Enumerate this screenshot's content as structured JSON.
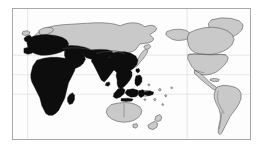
{
  "figure": {
    "kind": "world-map",
    "projection": "pacific-centered-cylindrical",
    "caption": "",
    "frame": {
      "x": 12,
      "y": 8,
      "width": 239,
      "height": 132,
      "border_color": "#a9a9a9",
      "background_color": "#fefefe"
    }
  },
  "legend": {
    "highlight_label": "",
    "plain_label": ""
  },
  "colors": {
    "highlight_fill": "#0d0d0d",
    "plain_fill": "#c9c9c9",
    "coastline": "#4a4a4a",
    "internal_border": "#5a5a5a",
    "graticule": "#d8d8d8",
    "ocean": "#fefefe",
    "page_background": "#ffffff"
  },
  "graticule": {
    "visible": true,
    "parallels": [
      {
        "name": "tropic-of-cancer",
        "y_fraction": 0.355
      },
      {
        "name": "equator",
        "y_fraction": 0.505
      },
      {
        "name": "tropic-of-capricorn",
        "y_fraction": 0.655
      }
    ],
    "meridians": [
      {
        "name": "meridian-west",
        "x_fraction": 0.062
      },
      {
        "name": "meridian-east",
        "x_fraction": 0.735
      }
    ]
  },
  "map_data": {
    "type": "choropleth-binary",
    "highlighted_regions": [
      "Africa",
      "Europe",
      "Middle East",
      "South Asia",
      "Southeast Asia",
      "Indonesia",
      "Philippines",
      "Madagascar",
      "Sri Lanka",
      "Central Asia (southern)",
      "China (southern and eastern)"
    ],
    "plain_regions": [
      "North America",
      "Greenland",
      "South America",
      "Russia",
      "Siberia",
      "Mongolia",
      "Japan",
      "Korea",
      "Australia",
      "New Zealand",
      "Papua New Guinea",
      "Iceland",
      "Scandinavia (northern)"
    ]
  }
}
